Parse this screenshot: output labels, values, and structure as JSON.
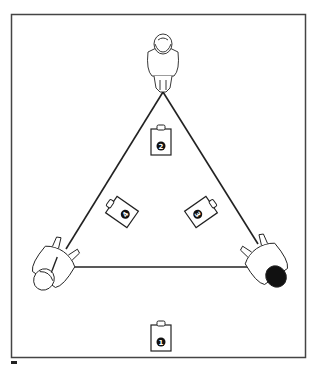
{
  "diagram": {
    "type": "speaker-listener-layout",
    "colors": {
      "stroke": "#222222",
      "background": "#ffffff",
      "frame": "#444444"
    },
    "listeners": [
      {
        "id": "top",
        "position": "top-center",
        "hair": "light"
      },
      {
        "id": "left",
        "position": "bottom-left",
        "hair": "light"
      },
      {
        "id": "right",
        "position": "bottom-right",
        "hair": "dark"
      }
    ],
    "speakers": [
      {
        "id": "1",
        "label": "1",
        "position": "bottom-center, outside triangle"
      },
      {
        "id": "2",
        "label": "2",
        "position": "inside triangle, near apex"
      },
      {
        "id": "3",
        "label": "3",
        "position": "inside triangle, right, angled"
      },
      {
        "id": "4",
        "label": "4",
        "position": "inside triangle, left, angled"
      }
    ],
    "connections": "equilateral triangle between the three listeners"
  }
}
